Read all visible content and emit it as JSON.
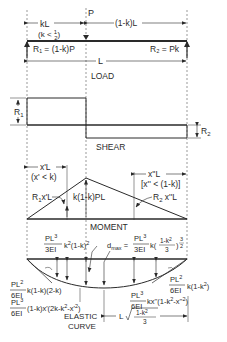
{
  "load_diagram": {
    "span_left": "kL",
    "span_left_condition": "(k < 1/2)",
    "load_label": "P",
    "span_right": "(1-k)L",
    "reaction_left": "R₁ = (1-k)P",
    "reaction_right": "R₂ = Pk",
    "total_span": "L",
    "title": "LOAD"
  },
  "shear_diagram": {
    "left_label": "R₁",
    "right_label": "R₂",
    "title": "SHEAR"
  },
  "moment_diagram": {
    "left_dim": "x'L",
    "left_condition": "(x' < k)",
    "right_dim": "x''L",
    "right_condition": "[x'' < (1-k)]",
    "left_moment": "R₁x'L",
    "max_moment": "k(1-k)PL",
    "right_moment": "R₂ x''L",
    "title": "MOMENT"
  },
  "deflection_diagram": {
    "load_point_deflection": "PL³/3EI k²(1-k)²",
    "dmax": "d_max = PL³/3EI k((1-k²)/3)^(3/2)",
    "left_slope": "PL²/6EI k(1-k)(2-k)",
    "left_deflection": "PL³/6EI (1-k)x'(2k-k²-x'²)",
    "right_slope": "PL²/6EI k(1-k²)",
    "right_deflection": "PL³/6EI kx''(1-k²-x''²)",
    "dmax_location": "L √((1-k²)/3)",
    "title_line1": "ELASTIC",
    "title_line2": "CURVE"
  }
}
